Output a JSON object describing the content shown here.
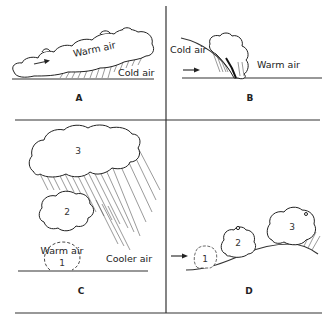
{
  "figure": {
    "panels": [
      {
        "id": "A",
        "label": "A",
        "description": "Warm front: warm air overriding cold air wedge",
        "labels": [
          "Warm air",
          "Cold air"
        ]
      },
      {
        "id": "B",
        "label": "B",
        "description": "Cold front: cold air pushing under warm air",
        "labels": [
          "Cold air",
          "Warm air"
        ]
      },
      {
        "id": "C",
        "label": "C",
        "description": "Convective lifting: rising warm air bubble grows into rain cloud",
        "labels": [
          "Warm air",
          "Cooler air"
        ],
        "stages": [
          "1",
          "2",
          "3"
        ]
      },
      {
        "id": "D",
        "label": "D",
        "description": "Orographic lifting: air pushed up slope forming cloud",
        "stages": [
          "1",
          "2",
          "3"
        ]
      }
    ]
  }
}
